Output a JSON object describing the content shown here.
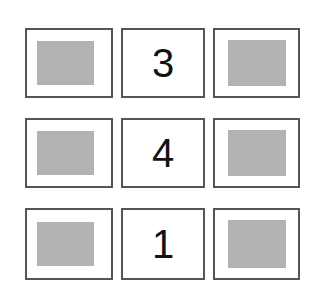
{
  "canvas": {
    "background": "#ffffff",
    "width": 325,
    "height": 308
  },
  "style": {
    "border_color": "#555555",
    "thumb_color": "#b2b2b2",
    "digit_color": "#121212"
  },
  "grid": {
    "rows": 3,
    "columns": 3,
    "cells": [
      [
        {
          "type": "image",
          "name": "image-placeholder",
          "value": ""
        },
        {
          "type": "digit",
          "name": "digit-cell",
          "value": "3"
        },
        {
          "type": "image",
          "name": "image-placeholder",
          "value": ""
        }
      ],
      [
        {
          "type": "image",
          "name": "image-placeholder",
          "value": ""
        },
        {
          "type": "digit",
          "name": "digit-cell",
          "value": "4"
        },
        {
          "type": "image",
          "name": "image-placeholder",
          "value": ""
        }
      ],
      [
        {
          "type": "image",
          "name": "image-placeholder",
          "value": ""
        },
        {
          "type": "digit",
          "name": "digit-cell",
          "value": "1"
        },
        {
          "type": "image",
          "name": "image-placeholder",
          "value": ""
        }
      ]
    ]
  }
}
